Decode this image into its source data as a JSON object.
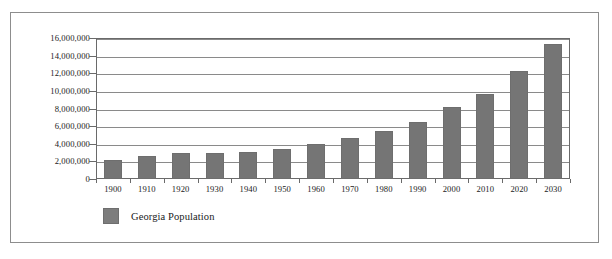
{
  "chart_data": {
    "type": "bar",
    "title": "",
    "subtitle": "",
    "xlabel": "",
    "ylabel": "",
    "categories": [
      "1900",
      "1910",
      "1920",
      "1930",
      "1940",
      "1950",
      "1960",
      "1970",
      "1980",
      "1990",
      "2000",
      "2010",
      "2020",
      "2030"
    ],
    "series": [
      {
        "name": "Georgia Population",
        "values": [
          2200000,
          2600000,
          2900000,
          2900000,
          3100000,
          3450000,
          3950000,
          4600000,
          5500000,
          6500000,
          8200000,
          9700000,
          12300000,
          15300000
        ]
      }
    ],
    "values": [
      2200000,
      2600000,
      2900000,
      2900000,
      3100000,
      3450000,
      3950000,
      4600000,
      5500000,
      6500000,
      8200000,
      9700000,
      12300000,
      15300000
    ],
    "ylim": [
      0,
      16000000
    ],
    "ytick_values": [
      0,
      2000000,
      4000000,
      6000000,
      8000000,
      10000000,
      12000000,
      14000000,
      16000000
    ],
    "ytick_labels": [
      "0",
      "2,000,000",
      "4,000,000",
      "6,000,000",
      "8,000,000",
      "10,000,000",
      "12,000,000",
      "14,000,000",
      "16,000,000"
    ],
    "grid": true,
    "legend_position": "bottom-left",
    "legend_entries": [
      "Georgia Population"
    ],
    "colors": {
      "bar_fill": "#757575",
      "bar_stroke": "#6e6e6e",
      "gridline": "#8a8a8a",
      "axis": "#6a6a6a",
      "frame": "#8d8d8d",
      "text": "#1a1a1a",
      "background": "#ffffff"
    }
  },
  "legend": {
    "swatch_name": "legend-color-swatch",
    "label": "Georgia Population"
  },
  "axes": {
    "y_ticks": [
      "16,000,000",
      "14,000,000",
      "12,000,000",
      "10,000,000",
      "8,000,000",
      "6,000,000",
      "4,000,000",
      "2,000,000",
      "0"
    ],
    "x_ticks": [
      "1900",
      "1910",
      "1920",
      "1930",
      "1940",
      "1950",
      "1960",
      "1970",
      "1980",
      "1990",
      "2000",
      "2010",
      "2020",
      "2030"
    ]
  }
}
